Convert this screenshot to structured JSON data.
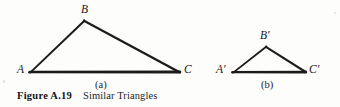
{
  "figure": {
    "caption_number": "Figure A.19",
    "caption_title": "Similar Triangles",
    "background_color": "#fdfdfc",
    "ink_color": "#161616"
  },
  "panels": [
    {
      "key": "a",
      "label": "(a)",
      "label_x": 95,
      "label_y": 80,
      "triangle": {
        "name": "triangle-abc",
        "stroke_color": "#1a1a1a",
        "vertices": [
          {
            "name": "A",
            "label": "A",
            "x": 29,
            "y": 72,
            "label_x": 17,
            "label_y": 64
          },
          {
            "name": "B",
            "label": "B",
            "x": 84,
            "y": 20,
            "label_x": 81,
            "label_y": 4
          },
          {
            "name": "C",
            "label": "C",
            "x": 180,
            "y": 72,
            "label_x": 184,
            "label_y": 64
          }
        ]
      }
    },
    {
      "key": "b",
      "label": "(b)",
      "label_x": 261,
      "label_y": 80,
      "triangle": {
        "name": "triangle-a-prime-b-prime-c-prime",
        "stroke_color": "#1a1a1a",
        "vertices": [
          {
            "name": "A-prime",
            "label": "A′",
            "x": 232,
            "y": 72,
            "label_x": 216,
            "label_y": 64
          },
          {
            "name": "B-prime",
            "label": "B′",
            "x": 266,
            "y": 46,
            "label_x": 260,
            "label_y": 30
          },
          {
            "name": "C-prime",
            "label": "C′",
            "x": 306,
            "y": 72,
            "label_x": 309,
            "label_y": 64
          }
        ]
      }
    }
  ]
}
